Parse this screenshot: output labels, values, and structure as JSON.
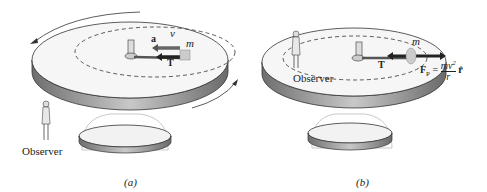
{
  "panels": [
    {
      "caption": "(a)",
      "observer_label": "Observer",
      "vectors": {
        "acceleration": "a",
        "tension": "T"
      },
      "mass_label": "m",
      "velocity_label": "v"
    },
    {
      "caption": "(b)",
      "observer_label": "Observer",
      "vectors": {
        "tension": "T"
      },
      "mass_label": "m",
      "pseudo_force": {
        "symbol": "F",
        "subscript": "P",
        "equals": "=",
        "numerator": "mv",
        "exponent": "2",
        "denominator": "r",
        "unit_vector": "r̂"
      }
    }
  ],
  "colors": {
    "platform_top": "#f4f4f4",
    "platform_side": "#8a8a8a",
    "arrow": "#2a2a2a",
    "line": "#333333"
  }
}
